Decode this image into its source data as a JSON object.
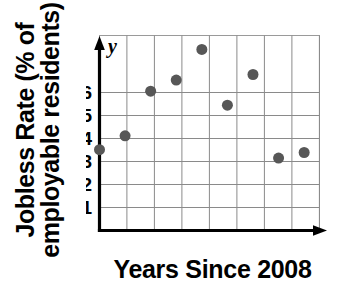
{
  "chart_data": {
    "type": "scatter",
    "title": "",
    "xlabel": "Years Since 2008",
    "ylabel": "Jobless Rate (% of\nemployable residents)",
    "ylabel_line1": "Jobless Rate (% of",
    "ylabel_line2": "employable residents)",
    "x_axis_variable": "x",
    "y_axis_variable": "y",
    "origin_label": "O",
    "xlim": [
      0,
      8.6
    ],
    "ylim": [
      0,
      7
    ],
    "xticks": [
      1,
      2,
      3,
      4,
      5,
      6,
      7,
      8
    ],
    "xticklabels": [
      "1",
      "2",
      "3",
      "4",
      "5",
      "6",
      "7",
      "8"
    ],
    "yticks": [
      1,
      2,
      3,
      4,
      5,
      6
    ],
    "yticklabels": [
      "1",
      "2",
      "3",
      "4",
      "5",
      "6"
    ],
    "grid": true,
    "legend": "none",
    "marker_color": "#575757",
    "marker_size": 11,
    "x": [
      0,
      1,
      2,
      3,
      4,
      5,
      6,
      7,
      8
    ],
    "values": [
      2.9,
      3.4,
      5.0,
      5.4,
      6.5,
      4.5,
      5.6,
      2.6,
      2.8
    ],
    "points": [
      {
        "x": 0,
        "y": 2.9
      },
      {
        "x": 1,
        "y": 3.4
      },
      {
        "x": 2,
        "y": 5.0
      },
      {
        "x": 3,
        "y": 5.4
      },
      {
        "x": 4,
        "y": 6.5
      },
      {
        "x": 5,
        "y": 4.5
      },
      {
        "x": 6,
        "y": 5.6
      },
      {
        "x": 7,
        "y": 2.6
      },
      {
        "x": 8,
        "y": 2.8
      }
    ]
  }
}
